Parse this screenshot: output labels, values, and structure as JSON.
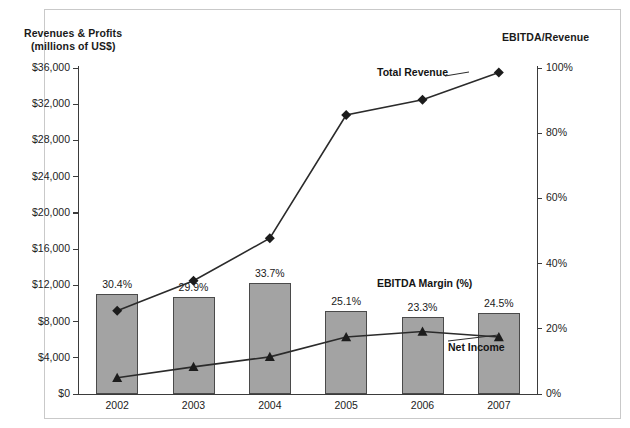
{
  "axis_titles": {
    "left_line1": "Revenues & Profits",
    "left_line2": "(millions of US$)",
    "right": "EBITDA/Revenue"
  },
  "annotations": {
    "total_revenue": "Total Revenue",
    "ebitda_margin": "EBITDA Margin (%)",
    "net_income": "Net Income"
  },
  "left_ticks": [
    "$36,000",
    "$32,000",
    "$28,000",
    "$24,000",
    "$20,000",
    "$16,000",
    "$12,000",
    "$8,000",
    "$4,000",
    "$0"
  ],
  "right_ticks": [
    "100%",
    "80%",
    "60%",
    "40%",
    "20%",
    "0%"
  ],
  "years": [
    "2002",
    "2003",
    "2004",
    "2005",
    "2006",
    "2007"
  ],
  "bar_labels": [
    "30.4%",
    "29.9%",
    "33.7%",
    "25.1%",
    "23.3%",
    "24.5%"
  ],
  "colors": {
    "bar_fill": "#a3a3a3",
    "bar_stroke": "#4a4a4a",
    "line": "#2b2b2b",
    "axis": "#3b3b3b",
    "frame": "#c9c9c9",
    "text": "#1a1a1a"
  },
  "chart_data": {
    "type": "bar",
    "xlabel": "",
    "ylabel": "Revenues & Profits (millions of US$)",
    "y2label": "EBITDA/Revenue",
    "categories": [
      "2002",
      "2003",
      "2004",
      "2005",
      "2006",
      "2007"
    ],
    "ylim": [
      0,
      36000
    ],
    "y2lim": [
      0,
      100
    ],
    "ytick_values": [
      0,
      4000,
      8000,
      12000,
      16000,
      20000,
      24000,
      28000,
      32000,
      36000
    ],
    "y2tick_values": [
      0,
      20,
      40,
      60,
      80,
      100
    ],
    "grid": false,
    "legend": "annotated-inline",
    "series": [
      {
        "name": "EBITDA",
        "type": "bar",
        "axis": "left",
        "values": [
          11000,
          10700,
          12300,
          9200,
          8500,
          9000
        ],
        "data_labels": [
          "30.4%",
          "29.9%",
          "33.7%",
          "25.1%",
          "23.3%",
          "24.5%"
        ],
        "data_label_meaning": "EBITDA Margin (%)"
      },
      {
        "name": "Total Revenue",
        "type": "line",
        "marker": "diamond",
        "axis": "left",
        "values": [
          9200,
          12500,
          17200,
          30800,
          32500,
          35500
        ]
      },
      {
        "name": "Net Income",
        "type": "line",
        "marker": "triangle",
        "axis": "left",
        "values": [
          1800,
          3000,
          4100,
          6300,
          6900,
          6300
        ]
      },
      {
        "name": "EBITDA Margin (%)",
        "type": "label-only",
        "axis": "right",
        "values": [
          30.4,
          29.9,
          33.7,
          25.1,
          23.3,
          24.5
        ]
      }
    ]
  }
}
